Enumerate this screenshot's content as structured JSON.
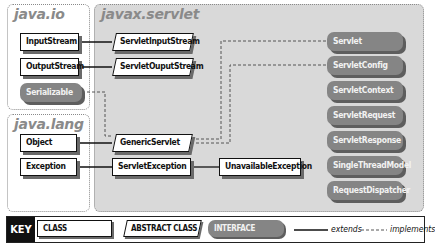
{
  "packages": [
    {
      "name": "java.io"
    },
    {
      "name": "java.lang"
    },
    {
      "name": "javax.servlet"
    }
  ],
  "java_io": {
    "title": "java.io",
    "classes": [
      "InputStream",
      "OutputStream"
    ],
    "interfaces": [
      "Serializable"
    ]
  },
  "java_lang": {
    "title": "java.lang",
    "classes": [
      "Object",
      "Exception"
    ]
  },
  "javax_servlet": {
    "title": "javax.servlet",
    "classes": [
      "ServletInputStream",
      "ServletOuputStream",
      "ServletException",
      "UnavailableException"
    ],
    "abstract_classes": [
      "GenericServlet"
    ],
    "interfaces": [
      "Servlet",
      "ServletConfig",
      "ServletContext",
      "ServletRequest",
      "ServletResponse",
      "SingleThreadModel",
      "RequestDispatcher"
    ]
  },
  "relations": {
    "extends": [
      [
        "ServletInputStream",
        "InputStream"
      ],
      [
        "ServletOuputStream",
        "OutputStream"
      ],
      [
        "GenericServlet",
        "Object"
      ],
      [
        "ServletException",
        "Exception"
      ],
      [
        "UnavailableException",
        "ServletException"
      ]
    ],
    "implements": [
      [
        "GenericServlet",
        "Serializable"
      ],
      [
        "GenericServlet",
        "Servlet"
      ],
      [
        "GenericServlet",
        "ServletConfig"
      ]
    ]
  },
  "key": {
    "label": "KEY",
    "class": "CLASS",
    "abstract_class": "ABSTRACT CLASS",
    "interface": "INTERFACE",
    "extends": "extends",
    "implements": "implements"
  },
  "colors": {
    "interface_fill": "#858585",
    "panel_fill": "#d9d9d9",
    "panel_title": "#8a8a8a"
  }
}
